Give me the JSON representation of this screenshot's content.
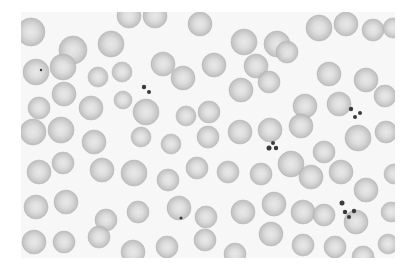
{
  "image": {
    "subject": "blood smear micrograph",
    "background_color": "#f7f7f7",
    "cell_fill": "#c9c9c9",
    "cell_edge": "#b3b3b3",
    "cell_center": "#e6e6e6",
    "platelet_color": "#3a3a3a",
    "frame": {
      "x": 21,
      "y": 12,
      "w": 374,
      "h": 246
    }
  },
  "cells": [
    [
      10,
      20,
      14
    ],
    [
      52,
      38,
      14
    ],
    [
      90,
      32,
      13
    ],
    [
      108,
      4,
      12
    ],
    [
      134,
      4,
      12
    ],
    [
      179,
      12,
      12
    ],
    [
      223,
      30,
      13
    ],
    [
      15,
      60,
      13
    ],
    [
      42,
      55,
      13
    ],
    [
      77,
      65,
      10
    ],
    [
      101,
      60,
      10
    ],
    [
      142,
      52,
      12
    ],
    [
      162,
      66,
      12
    ],
    [
      193,
      53,
      12
    ],
    [
      235,
      54,
      12
    ],
    [
      256,
      32,
      13
    ],
    [
      266,
      40,
      11
    ],
    [
      298,
      16,
      13
    ],
    [
      325,
      12,
      12
    ],
    [
      352,
      18,
      11
    ],
    [
      372,
      16,
      10
    ],
    [
      18,
      96,
      11
    ],
    [
      43,
      82,
      12
    ],
    [
      70,
      96,
      12
    ],
    [
      102,
      88,
      9
    ],
    [
      125,
      100,
      13
    ],
    [
      165,
      104,
      10
    ],
    [
      188,
      100,
      11
    ],
    [
      220,
      78,
      12
    ],
    [
      248,
      70,
      11
    ],
    [
      284,
      94,
      12
    ],
    [
      308,
      62,
      12
    ],
    [
      318,
      92,
      12
    ],
    [
      345,
      68,
      12
    ],
    [
      364,
      84,
      11
    ],
    [
      12,
      120,
      13
    ],
    [
      40,
      118,
      13
    ],
    [
      73,
      130,
      12
    ],
    [
      120,
      125,
      10
    ],
    [
      150,
      132,
      10
    ],
    [
      187,
      125,
      11
    ],
    [
      219,
      120,
      12
    ],
    [
      249,
      118,
      12
    ],
    [
      280,
      114,
      12
    ],
    [
      303,
      140,
      11
    ],
    [
      337,
      126,
      13
    ],
    [
      365,
      120,
      11
    ],
    [
      18,
      160,
      12
    ],
    [
      42,
      151,
      11
    ],
    [
      81,
      158,
      12
    ],
    [
      113,
      161,
      13
    ],
    [
      147,
      168,
      11
    ],
    [
      176,
      156,
      11
    ],
    [
      207,
      160,
      11
    ],
    [
      240,
      162,
      11
    ],
    [
      270,
      152,
      13
    ],
    [
      290,
      165,
      12
    ],
    [
      320,
      160,
      12
    ],
    [
      345,
      178,
      12
    ],
    [
      373,
      162,
      10
    ],
    [
      15,
      195,
      12
    ],
    [
      45,
      190,
      12
    ],
    [
      85,
      208,
      11
    ],
    [
      117,
      200,
      11
    ],
    [
      158,
      196,
      12
    ],
    [
      185,
      205,
      11
    ],
    [
      222,
      200,
      12
    ],
    [
      253,
      192,
      12
    ],
    [
      282,
      200,
      12
    ],
    [
      303,
      203,
      11
    ],
    [
      335,
      210,
      12
    ],
    [
      370,
      200,
      10
    ],
    [
      13,
      230,
      12
    ],
    [
      43,
      230,
      11
    ],
    [
      78,
      225,
      11
    ],
    [
      112,
      240,
      12
    ],
    [
      146,
      235,
      11
    ],
    [
      184,
      228,
      11
    ],
    [
      214,
      242,
      11
    ],
    [
      250,
      222,
      12
    ],
    [
      282,
      233,
      11
    ],
    [
      314,
      235,
      11
    ],
    [
      342,
      245,
      11
    ],
    [
      367,
      232,
      10
    ]
  ],
  "platelets": [
    [
      123,
      75,
      2.2
    ],
    [
      128,
      80,
      2
    ],
    [
      248,
      136,
      2.5
    ],
    [
      252,
      131,
      2
    ],
    [
      255,
      136,
      2.2
    ],
    [
      330,
      97,
      2.2
    ],
    [
      334,
      105,
      2
    ],
    [
      339,
      101,
      2
    ],
    [
      321,
      191,
      2.5
    ],
    [
      324,
      200,
      2.2
    ],
    [
      328,
      205,
      2
    ],
    [
      333,
      199,
      2.2
    ],
    [
      160,
      206,
      1.5
    ],
    [
      20,
      58,
      1.2
    ]
  ]
}
